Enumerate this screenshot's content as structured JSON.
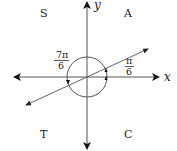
{
  "diagram": {
    "type": "unit-circle-quadrants",
    "axes": {
      "x_label": "x",
      "y_label": "y"
    },
    "quadrants": {
      "q1": "A",
      "q2": "S",
      "q3": "T",
      "q4": "C"
    },
    "angles": [
      {
        "numerator": "π",
        "denominator": "6",
        "position": "quadrant-1"
      },
      {
        "numerator": "7π",
        "denominator": "6",
        "position": "quadrant-3"
      }
    ],
    "colors": {
      "stroke": "#333333",
      "text": "#222222",
      "background": "#ffffff"
    }
  }
}
